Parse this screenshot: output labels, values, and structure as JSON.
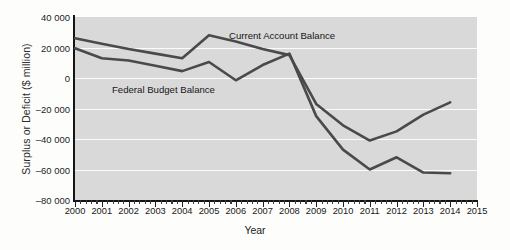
{
  "chart_data": {
    "type": "line",
    "title": "",
    "xlabel": "Year",
    "ylabel": "Surplus or Deficit ($ million)",
    "x": [
      2000,
      2001,
      2002,
      2003,
      2004,
      2005,
      2006,
      2007,
      2008,
      2009,
      2010,
      2011,
      2012,
      2013,
      2014
    ],
    "xlim": [
      2000,
      2015
    ],
    "ylim": [
      -80000,
      40000
    ],
    "ytick_labels": [
      "40 000",
      "20 000",
      "0",
      "–20 000",
      "–40 000",
      "–60 000",
      "–80 000"
    ],
    "ytick_values": [
      40000,
      20000,
      0,
      -20000,
      -40000,
      -60000,
      -80000
    ],
    "xtick_labels": [
      "2000",
      "2001",
      "2002",
      "2003",
      "2004",
      "2005",
      "2006",
      "2007",
      "2008",
      "2009",
      "2010",
      "2011",
      "2012",
      "2013",
      "2014",
      "2015"
    ],
    "grid": "horizontal",
    "legend": "inline-annotations",
    "series": [
      {
        "name": "Current Account Balance",
        "color": "#4a4a4a",
        "values": [
          26000,
          22500,
          19000,
          16000,
          13000,
          28000,
          24000,
          19000,
          15000,
          -17000,
          -31000,
          -41000,
          -35000,
          -24000,
          -16000
        ]
      },
      {
        "name": "Federal Budget Balance",
        "color": "#4a4a4a",
        "values": [
          19500,
          13000,
          11500,
          8000,
          4500,
          10500,
          -1500,
          8500,
          16000,
          -25000,
          -47000,
          -60000,
          -52000,
          -62000,
          -62500
        ]
      }
    ],
    "annotations": [
      {
        "text": "Current Account Balance",
        "series": "Current Account Balance"
      },
      {
        "text": "Federal Budget Balance",
        "series": "Federal Budget Balance"
      }
    ]
  },
  "axis": {
    "y_title": "Surplus or Deficit ($ million)",
    "x_title": "Year"
  }
}
